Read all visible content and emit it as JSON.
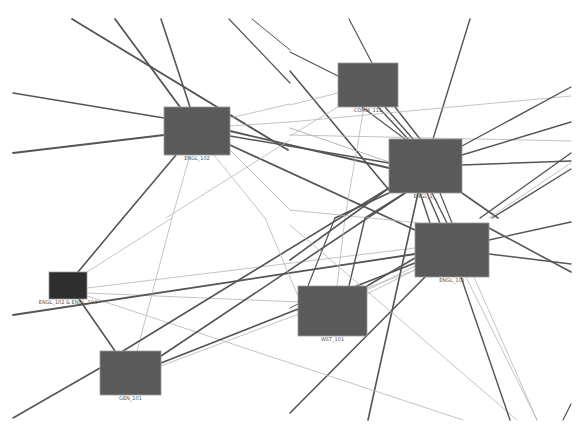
{
  "diagram": {
    "type": "network-graph",
    "colors": {
      "background": "#ffffff",
      "node_fill": "#5a5a5a",
      "node_fill_dark": "#2e2e2e",
      "edge_dark": "#555555",
      "edge_light": "#b5b5b5",
      "label": "#555555"
    },
    "nodes": [
      {
        "id": "engl102",
        "label": "ENGL_102",
        "x": 164,
        "y": 107,
        "w": 66,
        "h": 48,
        "dark": false
      },
      {
        "id": "comm111",
        "label": "COMM_111",
        "x": 338,
        "y": 63,
        "w": 60,
        "h": 44,
        "dark": false
      },
      {
        "id": "engl1xx",
        "label": "ENGL_1__",
        "x": 389,
        "y": 139,
        "w": 73,
        "h": 54,
        "dark": false
      },
      {
        "id": "engl101",
        "label": "ENGL_101",
        "x": 415,
        "y": 223,
        "w": 74,
        "h": 54,
        "dark": false
      },
      {
        "id": "engl102_104",
        "label": "ENGL_102 & ENGL_104",
        "x": 49,
        "y": 272,
        "w": 38,
        "h": 27,
        "dark": true
      },
      {
        "id": "wst101",
        "label": "WST_101",
        "x": 298,
        "y": 286,
        "w": 69,
        "h": 50,
        "dark": false
      },
      {
        "id": "gen101",
        "label": "GEN_101",
        "x": 100,
        "y": 351,
        "w": 61,
        "h": 44,
        "dark": false
      }
    ],
    "edges": [
      {
        "x1": 72,
        "y1": 19,
        "x2": 288,
        "y2": 150,
        "w": 1.8,
        "light": false
      },
      {
        "x1": 115,
        "y1": 19,
        "x2": 180,
        "y2": 107,
        "w": 1.8,
        "light": false
      },
      {
        "x1": 161,
        "y1": 19,
        "x2": 190,
        "y2": 107,
        "w": 1.6,
        "light": false
      },
      {
        "x1": 229,
        "y1": 19,
        "x2": 290,
        "y2": 83,
        "w": 1.2,
        "light": false
      },
      {
        "x1": 252,
        "y1": 19,
        "x2": 290,
        "y2": 50,
        "w": 1.0,
        "light": false
      },
      {
        "x1": 13,
        "y1": 93,
        "x2": 164,
        "y2": 118,
        "w": 1.5,
        "light": false
      },
      {
        "x1": 13,
        "y1": 153,
        "x2": 164,
        "y2": 135,
        "w": 1.8,
        "light": false
      },
      {
        "x1": 230,
        "y1": 118,
        "x2": 290,
        "y2": 104,
        "w": 0.8,
        "light": true
      },
      {
        "x1": 230,
        "y1": 126,
        "x2": 290,
        "y2": 122,
        "w": 0.8,
        "light": true
      },
      {
        "x1": 230,
        "y1": 131,
        "x2": 389,
        "y2": 168,
        "w": 1.8,
        "light": false
      },
      {
        "x1": 230,
        "y1": 136,
        "x2": 389,
        "y2": 163,
        "w": 1.5,
        "light": false
      },
      {
        "x1": 230,
        "y1": 145,
        "x2": 415,
        "y2": 230,
        "w": 1.8,
        "light": false
      },
      {
        "x1": 176,
        "y1": 155,
        "x2": 123,
        "y2": 218,
        "w": 1.6,
        "light": false
      },
      {
        "x1": 190,
        "y1": 155,
        "x2": 172,
        "y2": 218,
        "w": 0.8,
        "light": true
      },
      {
        "x1": 214,
        "y1": 155,
        "x2": 265,
        "y2": 218,
        "w": 0.8,
        "light": true
      },
      {
        "x1": 230,
        "y1": 150,
        "x2": 290,
        "y2": 210,
        "w": 0.8,
        "light": true
      },
      {
        "x1": 290,
        "y1": 140,
        "x2": 166,
        "y2": 218,
        "w": 0.8,
        "light": true
      },
      {
        "x1": 290,
        "y1": 128,
        "x2": 389,
        "y2": 162,
        "w": 1.0,
        "light": true
      },
      {
        "x1": 290,
        "y1": 52,
        "x2": 338,
        "y2": 76,
        "w": 1.2,
        "light": false
      },
      {
        "x1": 290,
        "y1": 71,
        "x2": 389,
        "y2": 190,
        "w": 1.6,
        "light": false
      },
      {
        "x1": 290,
        "y1": 105,
        "x2": 338,
        "y2": 93,
        "w": 0.8,
        "light": true
      },
      {
        "x1": 290,
        "y1": 136,
        "x2": 338,
        "y2": 107,
        "w": 0.8,
        "light": true
      },
      {
        "x1": 349,
        "y1": 19,
        "x2": 372,
        "y2": 63,
        "w": 1.2,
        "light": false
      },
      {
        "x1": 378,
        "y1": 107,
        "x2": 408,
        "y2": 139,
        "w": 1.4,
        "light": false
      },
      {
        "x1": 385,
        "y1": 107,
        "x2": 413,
        "y2": 139,
        "w": 1.4,
        "light": false
      },
      {
        "x1": 395,
        "y1": 107,
        "x2": 420,
        "y2": 139,
        "w": 1.4,
        "light": false
      },
      {
        "x1": 362,
        "y1": 107,
        "x2": 405,
        "y2": 139,
        "w": 1.2,
        "light": false
      },
      {
        "x1": 364,
        "y1": 107,
        "x2": 345,
        "y2": 218,
        "w": 0.8,
        "light": true
      },
      {
        "x1": 470,
        "y1": 19,
        "x2": 433,
        "y2": 139,
        "w": 1.4,
        "light": false
      },
      {
        "x1": 290,
        "y1": 122,
        "x2": 571,
        "y2": 96,
        "w": 0.8,
        "light": true
      },
      {
        "x1": 290,
        "y1": 135,
        "x2": 571,
        "y2": 141,
        "w": 0.8,
        "light": true
      },
      {
        "x1": 462,
        "y1": 146,
        "x2": 571,
        "y2": 87,
        "w": 1.4,
        "light": false
      },
      {
        "x1": 462,
        "y1": 155,
        "x2": 571,
        "y2": 122,
        "w": 1.4,
        "light": false
      },
      {
        "x1": 462,
        "y1": 165,
        "x2": 571,
        "y2": 161,
        "w": 1.4,
        "light": false
      },
      {
        "x1": 462,
        "y1": 193,
        "x2": 498,
        "y2": 218,
        "w": 1.6,
        "light": false
      },
      {
        "x1": 571,
        "y1": 153,
        "x2": 480,
        "y2": 218,
        "w": 1.4,
        "light": false
      },
      {
        "x1": 571,
        "y1": 163,
        "x2": 489,
        "y2": 218,
        "w": 0.8,
        "light": true
      },
      {
        "x1": 571,
        "y1": 169,
        "x2": 492,
        "y2": 218,
        "w": 1.4,
        "light": false
      },
      {
        "x1": 389,
        "y1": 193,
        "x2": 335,
        "y2": 218,
        "w": 1.6,
        "light": false
      },
      {
        "x1": 405,
        "y1": 193,
        "x2": 365,
        "y2": 218,
        "w": 1.6,
        "light": false
      },
      {
        "x1": 420,
        "y1": 193,
        "x2": 430,
        "y2": 223,
        "w": 1.4,
        "light": false
      },
      {
        "x1": 427,
        "y1": 193,
        "x2": 440,
        "y2": 223,
        "w": 1.4,
        "light": false
      },
      {
        "x1": 432,
        "y1": 193,
        "x2": 447,
        "y2": 223,
        "w": 1.4,
        "light": false
      },
      {
        "x1": 440,
        "y1": 193,
        "x2": 452,
        "y2": 223,
        "w": 1.2,
        "light": false
      },
      {
        "x1": 123,
        "y1": 218,
        "x2": 78,
        "y2": 272,
        "w": 1.6,
        "light": false
      },
      {
        "x1": 172,
        "y1": 218,
        "x2": 87,
        "y2": 272,
        "w": 0.8,
        "light": true
      },
      {
        "x1": 87,
        "y1": 288,
        "x2": 415,
        "y2": 248,
        "w": 0.8,
        "light": true
      },
      {
        "x1": 87,
        "y1": 293,
        "x2": 298,
        "y2": 302,
        "w": 0.8,
        "light": true
      },
      {
        "x1": 87,
        "y1": 296,
        "x2": 290,
        "y2": 363,
        "w": 0.8,
        "light": true
      },
      {
        "x1": 13,
        "y1": 315,
        "x2": 415,
        "y2": 254,
        "w": 1.8,
        "light": false
      },
      {
        "x1": 79,
        "y1": 299,
        "x2": 115,
        "y2": 351,
        "w": 1.6,
        "light": false
      },
      {
        "x1": 13,
        "y1": 418,
        "x2": 100,
        "y2": 368,
        "w": 1.6,
        "light": false
      },
      {
        "x1": 172,
        "y1": 218,
        "x2": 137,
        "y2": 351,
        "w": 0.8,
        "light": true
      },
      {
        "x1": 123,
        "y1": 351,
        "x2": 389,
        "y2": 188,
        "w": 1.6,
        "light": false
      },
      {
        "x1": 161,
        "y1": 356,
        "x2": 405,
        "y2": 193,
        "w": 1.6,
        "light": false
      },
      {
        "x1": 161,
        "y1": 363,
        "x2": 415,
        "y2": 263,
        "w": 1.8,
        "light": false
      },
      {
        "x1": 161,
        "y1": 366,
        "x2": 415,
        "y2": 270,
        "w": 0.8,
        "light": true
      },
      {
        "x1": 265,
        "y1": 218,
        "x2": 298,
        "y2": 296,
        "w": 0.8,
        "light": true
      },
      {
        "x1": 290,
        "y1": 210,
        "x2": 420,
        "y2": 223,
        "w": 0.8,
        "light": true
      },
      {
        "x1": 335,
        "y1": 218,
        "x2": 298,
        "y2": 311,
        "w": 1.2,
        "light": false
      },
      {
        "x1": 345,
        "y1": 218,
        "x2": 337,
        "y2": 286,
        "w": 0.8,
        "light": true
      },
      {
        "x1": 365,
        "y1": 218,
        "x2": 349,
        "y2": 286,
        "w": 1.4,
        "light": false
      },
      {
        "x1": 367,
        "y1": 286,
        "x2": 415,
        "y2": 258,
        "w": 1.6,
        "light": false
      },
      {
        "x1": 367,
        "y1": 290,
        "x2": 415,
        "y2": 266,
        "w": 0.8,
        "light": true
      },
      {
        "x1": 367,
        "y1": 294,
        "x2": 415,
        "y2": 270,
        "w": 0.8,
        "light": true
      },
      {
        "x1": 298,
        "y1": 304,
        "x2": 290,
        "y2": 308,
        "w": 1.0,
        "light": false
      },
      {
        "x1": 389,
        "y1": 188,
        "x2": 290,
        "y2": 260,
        "w": 1.6,
        "light": false
      },
      {
        "x1": 418,
        "y1": 193,
        "x2": 368,
        "y2": 420,
        "w": 1.6,
        "light": false
      },
      {
        "x1": 425,
        "y1": 277,
        "x2": 290,
        "y2": 413,
        "w": 1.6,
        "light": false
      },
      {
        "x1": 290,
        "y1": 363,
        "x2": 463,
        "y2": 420,
        "w": 0.8,
        "light": true
      },
      {
        "x1": 290,
        "y1": 225,
        "x2": 517,
        "y2": 420,
        "w": 0.8,
        "light": true
      },
      {
        "x1": 461,
        "y1": 277,
        "x2": 510,
        "y2": 420,
        "w": 1.4,
        "light": false
      },
      {
        "x1": 466,
        "y1": 277,
        "x2": 537,
        "y2": 420,
        "w": 0.8,
        "light": true
      },
      {
        "x1": 474,
        "y1": 277,
        "x2": 537,
        "y2": 420,
        "w": 0.8,
        "light": true
      },
      {
        "x1": 489,
        "y1": 240,
        "x2": 571,
        "y2": 222,
        "w": 1.4,
        "light": false
      },
      {
        "x1": 489,
        "y1": 254,
        "x2": 571,
        "y2": 264,
        "w": 1.4,
        "light": false
      },
      {
        "x1": 489,
        "y1": 228,
        "x2": 571,
        "y2": 272,
        "w": 1.6,
        "light": false
      },
      {
        "x1": 571,
        "y1": 404,
        "x2": 563,
        "y2": 420,
        "w": 1.2,
        "light": false
      }
    ]
  }
}
